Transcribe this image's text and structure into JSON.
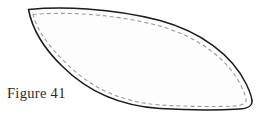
{
  "figure": {
    "caption": "Figure 41",
    "shape_name": "leaf-petal-pattern-outline",
    "canvas": {
      "width": 262,
      "height": 121,
      "background_color": "#ffffff"
    },
    "outline": {
      "stroke_color": "#1a1a1a",
      "stroke_width": 1.5,
      "fill_color": "#fdfdfd",
      "style": "solid",
      "path": "M 28.5 9.5 C 60 6.5 110 7.5 160 20.5 C 200 31.5 232 54.5 246.5 84.5 C 250 92 252.5 98 252 102.5 C 251.5 106.5 247 108.5 240 109 C 215 110.5 185 110 160 108.5 C 120 106 88 92 62 66 C 44 48.5 32 28 28.5 9.5 Z"
    },
    "stitch_line": {
      "stroke_color": "#9a9a9a",
      "stroke_width": 1.1,
      "style": "dashed",
      "dash_pattern": "4 3",
      "path": "M 33 14.5 C 62 12 110 13 158 25.5 C 196 36 227 57.5 241 85.5 C 244 92 246.5 97.5 246 101 C 245.5 104 241 105.5 235 106 C 212 107 185 106.5 161 105 C 123 102.5 92 89 67 64 C 50 47.5 37 31 33 14.5 Z"
    },
    "key_points": {
      "left_tip": [
        28,
        9
      ],
      "right_tip": [
        252,
        103
      ],
      "lowest_point": [
        185,
        110
      ]
    }
  }
}
